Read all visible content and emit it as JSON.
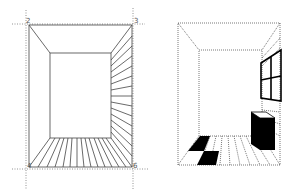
{
  "figure_left": {
    "description": "One-point perspective room construction with vanishing guides",
    "corner_labels": [
      "2",
      "3",
      "4",
      "6"
    ],
    "guide_style": "dotted",
    "wall_color": "#555555"
  },
  "figure_right": {
    "description": "Finished perspective room with window, box and checkered floor tiles",
    "fill_color": "#000000"
  }
}
